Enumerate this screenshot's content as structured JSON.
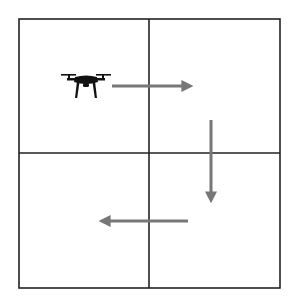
{
  "diagram": {
    "type": "grid-flight-path",
    "grid": {
      "rows": 2,
      "cols": 2,
      "left": 19,
      "top": 19,
      "right": 280,
      "bottom": 288,
      "mid_x": 149,
      "mid_y": 153,
      "line_color": "#222222",
      "line_width": 1.6
    },
    "drone": {
      "icon": "drone-icon",
      "cell": "top-left",
      "x": 61,
      "y": 73,
      "width": 50,
      "height": 25,
      "color": "#111111"
    },
    "arrows": [
      {
        "id": "right",
        "direction": "right",
        "x1": 112,
        "y1": 86,
        "x2": 188,
        "y2": 86
      },
      {
        "id": "down",
        "direction": "down",
        "x1": 211,
        "y1": 120,
        "x2": 211,
        "y2": 198
      },
      {
        "id": "left",
        "direction": "left",
        "x1": 188,
        "y1": 221,
        "x2": 104,
        "y2": 221
      }
    ],
    "arrow_color": "#777777",
    "arrow_width": 3
  }
}
